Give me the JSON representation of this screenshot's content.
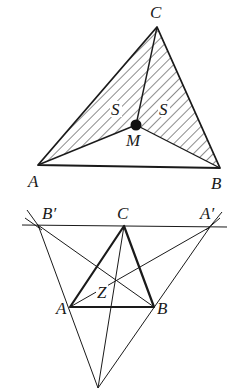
{
  "figure1": {
    "title": "Triangle ABC with interior point M",
    "labels": {
      "A": "A",
      "B": "B",
      "C": "C",
      "M": "M",
      "S_left": "S",
      "S_right": "S"
    },
    "points": {
      "A": [
        38,
        165
      ],
      "B": [
        220,
        168
      ],
      "C": [
        157,
        27
      ],
      "M": [
        136,
        125
      ]
    },
    "shaded_regions": [
      "triangle AMC",
      "triangle BMC"
    ],
    "colors": {
      "stroke": "#1a1a1a",
      "hatch": "#1a1a1a",
      "background": "#ffffff"
    }
  },
  "figure2": {
    "title": "Triangle ABC with anticomplementary construction",
    "labels": {
      "A": "A",
      "B": "B",
      "C": "C",
      "A_prime": "A′",
      "B_prime": "B′",
      "Z": "Z"
    },
    "points": {
      "A": [
        70,
        307
      ],
      "B": [
        154,
        307
      ],
      "C": [
        124,
        226
      ],
      "A_prime": [
        210,
        227
      ],
      "B_prime": [
        38,
        225
      ],
      "bottom": [
        98,
        388
      ]
    },
    "colors": {
      "stroke": "#1a1a1a",
      "background": "#ffffff"
    }
  }
}
